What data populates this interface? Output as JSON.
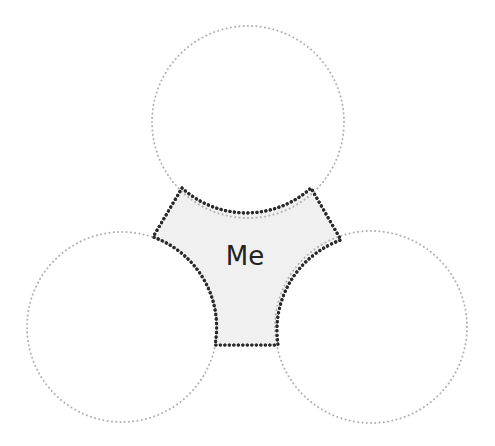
{
  "diagram": {
    "type": "three-circle-overlap",
    "center": {
      "label": "Me",
      "fill": "#f0f0f0",
      "stroke": "#2a2a2a",
      "text_color": "#222222"
    },
    "circles": [
      {
        "id": "top",
        "label": "",
        "cx": 248,
        "cy": 122,
        "r": 96
      },
      {
        "id": "left",
        "label": "",
        "cx": 122,
        "cy": 327,
        "r": 95
      },
      {
        "id": "right",
        "label": "",
        "cx": 371,
        "cy": 327,
        "r": 96
      }
    ],
    "circle_stroke": "#b0b0b0"
  }
}
